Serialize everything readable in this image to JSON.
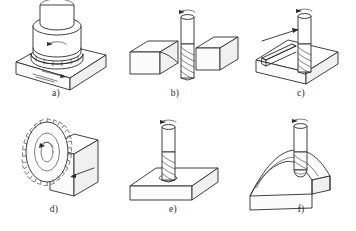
{
  "figure": {
    "background_color": "#ffffff",
    "line_color": "#2b2b2b",
    "shade_color": "#f0f0f0",
    "layout": {
      "columns": 3,
      "rows": 2
    }
  },
  "panels": [
    {
      "id": "a",
      "caption": "a)",
      "operation": "face-milling",
      "description": "Face mill with peripheral inserts cutting the top surface of a rectangular block",
      "tool": "face-mill-cutter",
      "workpiece": "rectangular-block",
      "has_rotation_arrow": true,
      "has_feed_arrow": true,
      "caption_x": 55,
      "caption_y": 91
    },
    {
      "id": "b",
      "caption": "b)",
      "operation": "step-shoulder-milling",
      "description": "End mill cutting a shoulder step between two block sections",
      "tool": "end-mill",
      "workpiece": "stepped-block",
      "has_rotation_arrow": true,
      "has_feed_arrow": false,
      "caption_x": 174,
      "caption_y": 91
    },
    {
      "id": "c",
      "caption": "c)",
      "operation": "slot-milling",
      "description": "End mill cutting a straight slot across a block with feed direction arrow",
      "tool": "end-mill",
      "workpiece": "slotted-block",
      "has_rotation_arrow": true,
      "has_feed_arrow": true,
      "caption_x": 300,
      "caption_y": 91
    },
    {
      "id": "d",
      "caption": "d)",
      "operation": "slitting-saw-milling",
      "description": "Toothed slitting saw blade cutting vertically into an upright block",
      "tool": "slitting-saw",
      "workpiece": "upright-block",
      "has_rotation_arrow": true,
      "has_feed_arrow": true,
      "caption_x": 53,
      "caption_y": 207
    },
    {
      "id": "e",
      "caption": "e)",
      "operation": "plunge-milling",
      "description": "End mill plunging vertically into a flat rectangular plate",
      "tool": "end-mill",
      "workpiece": "flat-plate",
      "has_rotation_arrow": true,
      "has_feed_arrow": false,
      "caption_x": 172,
      "caption_y": 207
    },
    {
      "id": "f",
      "caption": "f)",
      "operation": "contour-profile-milling",
      "description": "Ball-end mill machining a curved contoured surface on a shaped block",
      "tool": "ball-end-mill",
      "workpiece": "contoured-block",
      "has_rotation_arrow": true,
      "has_feed_arrow": false,
      "caption_x": 300,
      "caption_y": 207
    }
  ]
}
